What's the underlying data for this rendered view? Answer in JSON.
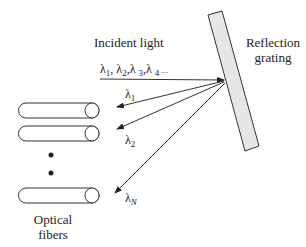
{
  "labels": {
    "incident_light": "Incident light",
    "reflection_grating_line1": "Reflection",
    "reflection_grating_line2": "grating",
    "optical_fibers_line1": "Optical",
    "optical_fibers_line2": "fibers"
  },
  "wavelengths": {
    "incident": {
      "l1": "λ",
      "s1": "1",
      "c1": ", λ",
      "s2": "2",
      "c2": ",λ ",
      "s3": "3",
      "c3": ",λ ",
      "s4": "4",
      "tail": " ..."
    },
    "out1": {
      "base": "λ",
      "sub": "1"
    },
    "out2": {
      "base": "λ",
      "sub": "2"
    },
    "outN": {
      "base": "λ",
      "sub": "N"
    }
  },
  "colors": {
    "grating_fill": "#e6e6e6",
    "stroke": "#333333"
  }
}
